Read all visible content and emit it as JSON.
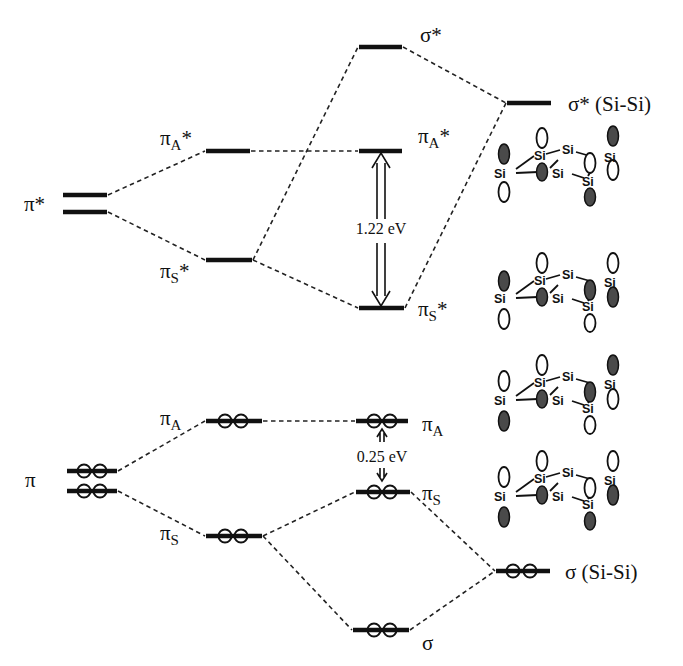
{
  "diagram": {
    "levels": {
      "pi_star_left": {
        "label_main": "π",
        "label_sup": "*"
      },
      "pi_A_star_mid": {
        "label_main": "π",
        "label_sub": "A",
        "label_sup": "*"
      },
      "pi_S_star_mid": {
        "label_main": "π",
        "label_sub": "S",
        "label_sup": "*"
      },
      "sigma_star_center": {
        "label_main": "σ",
        "label_sup": "*"
      },
      "pi_A_star_center": {
        "label_main": "π",
        "label_sub": "A",
        "label_sup": "*"
      },
      "pi_S_star_center": {
        "label_main": "π",
        "label_sub": "S",
        "label_sup": "*"
      },
      "sigma_star_sisi": {
        "label": "σ* (Si-Si)"
      },
      "pi_left": {
        "label_main": "π"
      },
      "pi_A_mid": {
        "label_main": "π",
        "label_sub": "A"
      },
      "pi_S_mid": {
        "label_main": "π",
        "label_sub": "S"
      },
      "pi_A_center": {
        "label_main": "π",
        "label_sub": "A"
      },
      "pi_S_center": {
        "label_main": "π",
        "label_sub": "S"
      },
      "sigma_sisi": {
        "label": "σ (Si-Si)"
      },
      "sigma_bottom": {
        "label_main": "σ"
      }
    },
    "gaps": {
      "unoccupied_gap": "1.22 eV",
      "occupied_gap": "0.25 eV"
    },
    "atom_label": "Si",
    "orbital_pictures": [
      {
        "name": "pi_A_star",
        "description": "πA* orbital lobes on Si framework"
      },
      {
        "name": "pi_S_star",
        "description": "πS* orbital lobes on Si framework"
      },
      {
        "name": "pi_A",
        "description": "πA orbital lobes on Si framework"
      },
      {
        "name": "pi_S",
        "description": "πS orbital lobes on Si framework"
      }
    ]
  }
}
